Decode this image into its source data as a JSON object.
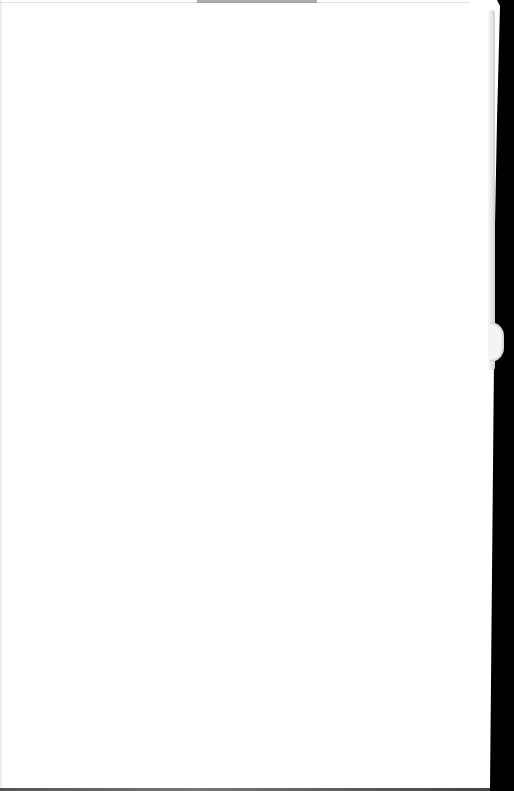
{
  "document": {
    "type": "scanned-book-page",
    "header_text": "",
    "body_text": "",
    "background_color": "#000000",
    "page_color": "#ffffff"
  }
}
